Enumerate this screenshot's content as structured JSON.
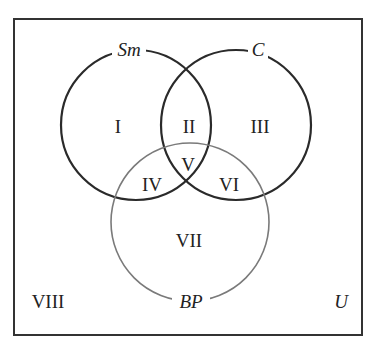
{
  "diagram": {
    "type": "venn",
    "universe_label": "U",
    "sets": [
      {
        "label": "Sm",
        "color": "#2a2a2a"
      },
      {
        "label": "C",
        "color": "#2a2a2a"
      },
      {
        "label": "BP",
        "color": "#777777"
      }
    ],
    "regions": [
      "I",
      "II",
      "III",
      "IV",
      "V",
      "VI",
      "VII",
      "VIII"
    ]
  }
}
